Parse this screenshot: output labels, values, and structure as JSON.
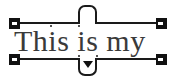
{
  "widget": {
    "type": "text-selection-frame",
    "content_text": "This is my",
    "colors": {
      "background": "#ffffff",
      "text": "#3a3a3a",
      "rail": "#1a1a1a",
      "handle_fill": "#111111",
      "handle_notch": "#ffffff"
    }
  },
  "handles": {
    "top_left_label": "top-left resize handle",
    "top_right_label": "top-right resize handle",
    "bottom_left_label": "bottom-left resize handle",
    "bottom_right_label": "bottom-right resize handle",
    "top_tab_label": "top adjust tab",
    "bottom_tab_label": "dropdown options handle",
    "caret_glyph": "▼"
  },
  "rails": {
    "top_label": "top baseline guide",
    "bottom_label": "bottom baseline guide"
  }
}
